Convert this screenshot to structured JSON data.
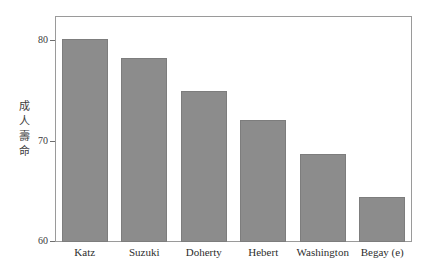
{
  "chart_data": {
    "type": "bar",
    "title": "",
    "subtitle": "",
    "xlabel": "",
    "ylabel": "成人壽命",
    "ylabel_chars": [
      "成",
      "人",
      "壽",
      "命"
    ],
    "categories": [
      "Katz",
      "Suzuki",
      "Doherty",
      "Hebert",
      "Washington",
      "Begay (e)"
    ],
    "values": [
      80.2,
      78.3,
      75.0,
      72.1,
      68.8,
      64.5
    ],
    "series": [
      {
        "name": "成人壽命",
        "values": [
          80.2,
          78.3,
          75.0,
          72.1,
          68.8,
          64.5
        ]
      }
    ],
    "ylim": [
      60,
      82.5
    ],
    "ytick_labels": [
      "60",
      "70",
      "80"
    ],
    "ytick_values": [
      60,
      70,
      80
    ],
    "grid": false,
    "legend": "none",
    "bar_color": "#8c8c8c",
    "bar_edge_color": "#7d7d7d",
    "frame_color": "#9a9a9a",
    "background_color": "#ffffff",
    "text_color": "#2e2e2e"
  }
}
